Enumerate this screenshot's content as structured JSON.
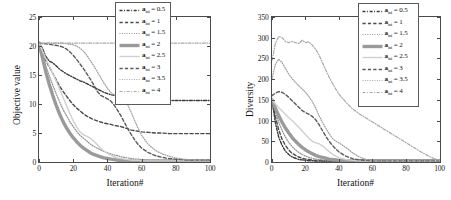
{
  "figure": {
    "background": "#ffffff",
    "line_color_dark": "#3f3f3f",
    "line_color_mid": "#7a7a7a",
    "line_color_light": "#b9b9b9",
    "axis_color": "#4a4a4a"
  },
  "panels": [
    {
      "id": "objective-value-panel",
      "xlabel": "Iteration#",
      "ylabel": "Objective value",
      "xticks": [
        "0",
        "20",
        "40",
        "60",
        "80",
        "100"
      ],
      "yticks": [
        "0",
        "5",
        "10",
        "15",
        "20",
        "25"
      ],
      "legend": {
        "symbol": "a",
        "subscript": "ini",
        "entries": [
          {
            "value": "0.5",
            "style": "dashdot",
            "color": "#3a3a3a",
            "width": 1.4
          },
          {
            "value": "1",
            "style": "dashed",
            "color": "#4a4a4a",
            "width": 1.4
          },
          {
            "value": "1.5",
            "style": "dotted",
            "color": "#8c8c8c",
            "width": 1.2
          },
          {
            "value": "2",
            "style": "solid",
            "color": "#9a9a9a",
            "width": 3.4
          },
          {
            "value": "2.5",
            "style": "solid",
            "color": "#cfcfcf",
            "width": 1.4
          },
          {
            "value": "3",
            "style": "dashed",
            "color": "#5a5a5a",
            "width": 1.4
          },
          {
            "value": "3.5",
            "style": "dotted",
            "color": "#9e9e9e",
            "width": 1.2
          },
          {
            "value": "4",
            "style": "dashdot",
            "color": "#a8a8a8",
            "width": 1.2
          }
        ]
      }
    },
    {
      "id": "diversity-panel",
      "xlabel": "Iteration#",
      "ylabel": "Diversity",
      "xticks": [
        "0",
        "20",
        "40",
        "60",
        "80",
        "100"
      ],
      "yticks": [
        "0",
        "50",
        "100",
        "150",
        "200",
        "250",
        "300",
        "350"
      ],
      "legend": {
        "symbol": "a",
        "subscript": "ini",
        "entries": [
          {
            "value": "0.5",
            "style": "dashdot",
            "color": "#3a3a3a",
            "width": 1.4
          },
          {
            "value": "1",
            "style": "dashed",
            "color": "#4a4a4a",
            "width": 1.4
          },
          {
            "value": "1.5",
            "style": "dotted",
            "color": "#8c8c8c",
            "width": 1.2
          },
          {
            "value": "2",
            "style": "solid",
            "color": "#9a9a9a",
            "width": 3.4
          },
          {
            "value": "2.5",
            "style": "solid",
            "color": "#cfcfcf",
            "width": 1.4
          },
          {
            "value": "3",
            "style": "dashed",
            "color": "#5a5a5a",
            "width": 1.4
          },
          {
            "value": "3.5",
            "style": "dotted",
            "color": "#9e9e9e",
            "width": 1.2
          },
          {
            "value": "4",
            "style": "dashdot",
            "color": "#a8a8a8",
            "width": 1.2
          }
        ]
      }
    }
  ],
  "chart_data": [
    {
      "type": "line",
      "title": "",
      "xlabel": "Iteration#",
      "ylabel": "Objective value",
      "xlim": [
        0,
        100
      ],
      "ylim": [
        0,
        25
      ],
      "xticks": [
        0,
        20,
        40,
        60,
        80,
        100
      ],
      "yticks": [
        0,
        5,
        10,
        15,
        20,
        25
      ],
      "grid": false,
      "legend_position": "upper-right",
      "x": [
        0,
        2,
        4,
        6,
        8,
        10,
        12,
        14,
        16,
        18,
        20,
        22,
        24,
        26,
        28,
        30,
        32,
        34,
        36,
        38,
        40,
        42,
        44,
        46,
        48,
        50,
        52,
        54,
        56,
        58,
        60,
        64,
        68,
        72,
        76,
        80,
        84,
        88,
        92,
        96,
        100
      ],
      "series": [
        {
          "name": "a_ini = 0.5",
          "values": [
            20.5,
            19.6,
            18.2,
            17.4,
            17.1,
            16.6,
            16.0,
            15.6,
            15.2,
            14.9,
            14.6,
            14.3,
            14.0,
            13.8,
            13.5,
            13.2,
            12.9,
            12.6,
            12.3,
            12.0,
            11.8,
            11.6,
            11.5,
            11.4,
            11.3,
            11.2,
            11.1,
            11.0,
            10.9,
            10.8,
            10.8,
            10.7,
            10.7,
            10.6,
            10.6,
            10.6,
            10.6,
            10.6,
            10.6,
            10.6,
            10.6
          ]
        },
        {
          "name": "a_ini = 1",
          "values": [
            20.5,
            19.0,
            17.5,
            16.4,
            15.3,
            14.2,
            13.1,
            12.2,
            11.4,
            10.6,
            9.9,
            9.3,
            8.8,
            8.3,
            7.9,
            7.6,
            7.3,
            7.1,
            6.9,
            6.7,
            6.6,
            6.5,
            6.3,
            6.2,
            6.1,
            5.9,
            5.7,
            5.5,
            5.4,
            5.3,
            5.2,
            5.1,
            5.0,
            5.0,
            4.9,
            4.9,
            4.9,
            4.9,
            4.9,
            4.9,
            4.9
          ]
        },
        {
          "name": "a_ini = 1.5",
          "values": [
            20.5,
            18.6,
            16.6,
            14.9,
            13.3,
            11.8,
            10.4,
            9.1,
            8.0,
            7.0,
            6.1,
            5.3,
            4.6,
            4.1,
            3.6,
            3.1,
            2.7,
            2.4,
            2.1,
            1.8,
            1.6,
            1.4,
            1.2,
            1.1,
            0.9,
            0.8,
            0.7,
            0.6,
            0.5,
            0.5,
            0.4,
            0.3,
            0.3,
            0.2,
            0.2,
            0.2,
            0.2,
            0.2,
            0.2,
            0.2,
            0.2
          ]
        },
        {
          "name": "a_ini = 2",
          "values": [
            20.5,
            18.0,
            15.5,
            13.4,
            11.5,
            9.8,
            8.3,
            7.0,
            5.9,
            5.0,
            4.2,
            3.5,
            2.9,
            2.4,
            2.0,
            1.6,
            1.3,
            1.1,
            0.9,
            0.7,
            0.6,
            0.5,
            0.4,
            0.3,
            0.3,
            0.2,
            0.2,
            0.2,
            0.2,
            0.2,
            0.2,
            0.2,
            0.2,
            0.2,
            0.2,
            0.2,
            0.2,
            0.2,
            0.2,
            0.2,
            0.2
          ]
        },
        {
          "name": "a_ini = 2.5",
          "values": [
            20.5,
            19.2,
            17.8,
            16.5,
            15.3,
            14.0,
            12.6,
            11.2,
            9.8,
            8.4,
            7.1,
            6.0,
            5.2,
            4.7,
            4.4,
            4.1,
            3.6,
            3.0,
            2.4,
            1.9,
            1.5,
            1.2,
            0.9,
            0.7,
            0.6,
            0.5,
            0.4,
            0.3,
            0.3,
            0.3,
            0.2,
            0.2,
            0.2,
            0.2,
            0.2,
            0.2,
            0.2,
            0.2,
            0.2,
            0.2,
            0.2
          ]
        },
        {
          "name": "a_ini = 3",
          "values": [
            20.5,
            20.4,
            20.4,
            20.3,
            20.2,
            20.1,
            20.0,
            19.8,
            19.5,
            19.0,
            18.4,
            17.7,
            16.9,
            16.1,
            15.2,
            14.3,
            13.3,
            12.2,
            11.5,
            11.2,
            10.9,
            10.5,
            9.8,
            8.9,
            7.9,
            6.8,
            5.7,
            4.7,
            3.8,
            3.0,
            2.4,
            1.6,
            1.1,
            0.8,
            0.6,
            0.5,
            0.4,
            0.3,
            0.3,
            0.3,
            0.3
          ]
        },
        {
          "name": "a_ini = 3.5",
          "values": [
            20.5,
            20.5,
            20.5,
            20.5,
            20.5,
            20.5,
            20.5,
            20.5,
            20.4,
            20.3,
            20.2,
            20.0,
            19.6,
            19.1,
            18.4,
            17.5,
            16.6,
            15.6,
            14.6,
            13.6,
            12.7,
            12.0,
            11.5,
            11.2,
            11.0,
            10.7,
            9.8,
            8.5,
            7.1,
            5.8,
            4.6,
            3.0,
            2.0,
            1.4,
            1.0,
            0.7,
            0.5,
            0.4,
            0.3,
            0.3,
            0.3
          ]
        },
        {
          "name": "a_ini = 4",
          "values": [
            20.5,
            20.5,
            20.5,
            20.5,
            20.5,
            20.5,
            20.5,
            20.5,
            20.5,
            20.5,
            20.5,
            20.5,
            20.5,
            20.5,
            20.5,
            20.5,
            20.5,
            20.5,
            20.5,
            20.5,
            20.5,
            20.5,
            20.5,
            20.5,
            20.5,
            20.5,
            20.5,
            20.5,
            20.5,
            20.5,
            20.5,
            20.5,
            20.5,
            20.5,
            20.5,
            20.5,
            20.5,
            20.5,
            20.5,
            20.5,
            20.5
          ]
        }
      ]
    },
    {
      "type": "line",
      "title": "",
      "xlabel": "Iteration#",
      "ylabel": "Diversity",
      "xlim": [
        0,
        100
      ],
      "ylim": [
        0,
        350
      ],
      "xticks": [
        0,
        20,
        40,
        60,
        80,
        100
      ],
      "yticks": [
        0,
        50,
        100,
        150,
        200,
        250,
        300,
        350
      ],
      "grid": false,
      "legend_position": "upper-right",
      "x": [
        0,
        2,
        4,
        6,
        8,
        10,
        12,
        14,
        16,
        18,
        20,
        22,
        24,
        26,
        28,
        30,
        32,
        34,
        36,
        38,
        40,
        44,
        48,
        52,
        56,
        60,
        64,
        68,
        72,
        76,
        80,
        84,
        88,
        92,
        96,
        100
      ],
      "series": [
        {
          "name": "a_ini = 0.5",
          "values": [
            150,
            95,
            60,
            40,
            26,
            18,
            12,
            9,
            6,
            5,
            4,
            3,
            3,
            2,
            2,
            2,
            2,
            2,
            2,
            2,
            2,
            2,
            2,
            2,
            2,
            2,
            2,
            2,
            2,
            2,
            2,
            2,
            2,
            2,
            2,
            2
          ]
        },
        {
          "name": "a_ini = 1",
          "values": [
            150,
            110,
            78,
            55,
            40,
            29,
            21,
            16,
            12,
            9,
            7,
            6,
            5,
            4,
            4,
            3,
            3,
            3,
            3,
            3,
            3,
            2,
            2,
            2,
            2,
            2,
            2,
            2,
            2,
            2,
            2,
            2,
            2,
            2,
            2,
            2
          ]
        },
        {
          "name": "a_ini = 1.5",
          "values": [
            152,
            122,
            96,
            76,
            60,
            47,
            37,
            29,
            23,
            18,
            14,
            11,
            9,
            7,
            6,
            5,
            4,
            4,
            3,
            3,
            3,
            3,
            3,
            3,
            3,
            3,
            3,
            3,
            3,
            3,
            3,
            3,
            3,
            3,
            3,
            3
          ]
        },
        {
          "name": "a_ini = 2",
          "values": [
            150,
            130,
            112,
            96,
            82,
            70,
            59,
            50,
            42,
            35,
            29,
            24,
            20,
            16,
            13,
            11,
            9,
            7,
            6,
            5,
            4,
            3,
            3,
            3,
            3,
            3,
            3,
            3,
            3,
            3,
            3,
            3,
            3,
            3,
            3,
            3
          ]
        },
        {
          "name": "a_ini = 2.5",
          "values": [
            150,
            140,
            131,
            123,
            115,
            107,
            100,
            92,
            84,
            75,
            66,
            57,
            50,
            46,
            44,
            39,
            32,
            25,
            19,
            14,
            10,
            6,
            4,
            3,
            3,
            3,
            3,
            3,
            3,
            3,
            3,
            3,
            3,
            3,
            3,
            3
          ]
        },
        {
          "name": "a_ini = 3",
          "values": [
            160,
            166,
            170,
            168,
            163,
            156,
            148,
            140,
            132,
            124,
            119,
            115,
            110,
            102,
            90,
            76,
            62,
            50,
            40,
            31,
            24,
            14,
            8,
            5,
            4,
            3,
            3,
            3,
            3,
            3,
            3,
            3,
            3,
            3,
            3,
            3
          ]
        },
        {
          "name": "a_ini = 3.5",
          "values": [
            200,
            236,
            248,
            240,
            226,
            212,
            201,
            192,
            184,
            176,
            168,
            158,
            146,
            130,
            112,
            96,
            82,
            68,
            57,
            50,
            46,
            35,
            22,
            12,
            6,
            4,
            3,
            3,
            3,
            3,
            3,
            3,
            3,
            3,
            3,
            3
          ]
        },
        {
          "name": "a_ini = 4",
          "values": [
            245,
            286,
            303,
            300,
            291,
            288,
            291,
            288,
            286,
            294,
            288,
            290,
            282,
            272,
            258,
            240,
            222,
            205,
            190,
            176,
            163,
            144,
            128,
            116,
            106,
            96,
            86,
            76,
            66,
            56,
            46,
            36,
            26,
            17,
            9,
            4
          ]
        }
      ]
    }
  ]
}
